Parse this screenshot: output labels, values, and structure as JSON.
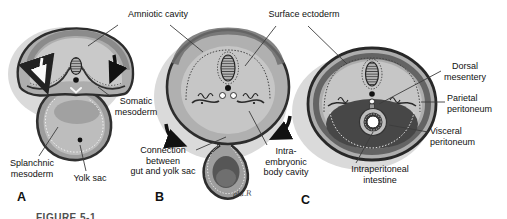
{
  "figure": {
    "caption": "FIGURE 5-1",
    "signature": "alu.R",
    "panels": [
      {
        "id": "A",
        "label": "A"
      },
      {
        "id": "B",
        "label": "B"
      },
      {
        "id": "C",
        "label": "C"
      }
    ],
    "annotations": {
      "amniotic_cavity": "Amniotic cavity",
      "surface_ectoderm": "Surface ectoderm",
      "somatic_mesoderm": "Somatic\nmesoderm",
      "splanchnic_mesoderm": "Splanchnic\nmesoderm",
      "yolk_sac": "Yolk sac",
      "connection_gut_yolk": "Connection\nbetween\ngut and yolk sac",
      "intraembryonic_body_cavity": "Intra-\nembryonic\nbody cavity",
      "intraperitoneal_intestine": "Intraperitoneal\nintestine",
      "dorsal_mesentery": "Dorsal\nmesentery",
      "parietal_peritoneum": "Parietal\nperitoneum",
      "visceral_peritoneum": "Visceral\nperitoneum"
    },
    "colors": {
      "background": "#ffffff",
      "ink": "#111111",
      "outline": "#2d2d2d",
      "body_gray": "#adadad",
      "cavity_gray": "#c8c8c8",
      "dark_cavity": "#474747",
      "halo_gray": "#dadada",
      "leader_line": "#3c3c3c"
    }
  }
}
